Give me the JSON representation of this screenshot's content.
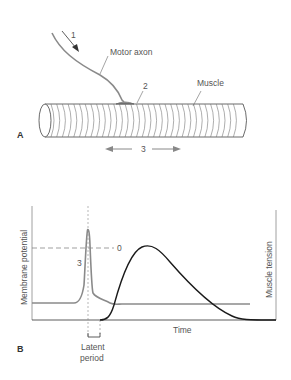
{
  "panel_a": {
    "letter": "A",
    "labels": {
      "num1": "1",
      "motor_axon": "Motor axon",
      "num2": "2",
      "muscle": "Muscle",
      "num3": "3"
    }
  },
  "panel_b": {
    "letter": "B",
    "labels": {
      "y_left": "Membrane potential",
      "y_right": "Muscle tension",
      "x": "Time",
      "zero": "0",
      "num3": "3",
      "latent1": "Latent",
      "latent2": "period"
    }
  },
  "colors": {
    "axon": "#8a8a8a",
    "membrane_curve": "#8a8a8a",
    "tension_curve": "#1a1a1a",
    "text": "#555555",
    "outline": "#444444"
  }
}
